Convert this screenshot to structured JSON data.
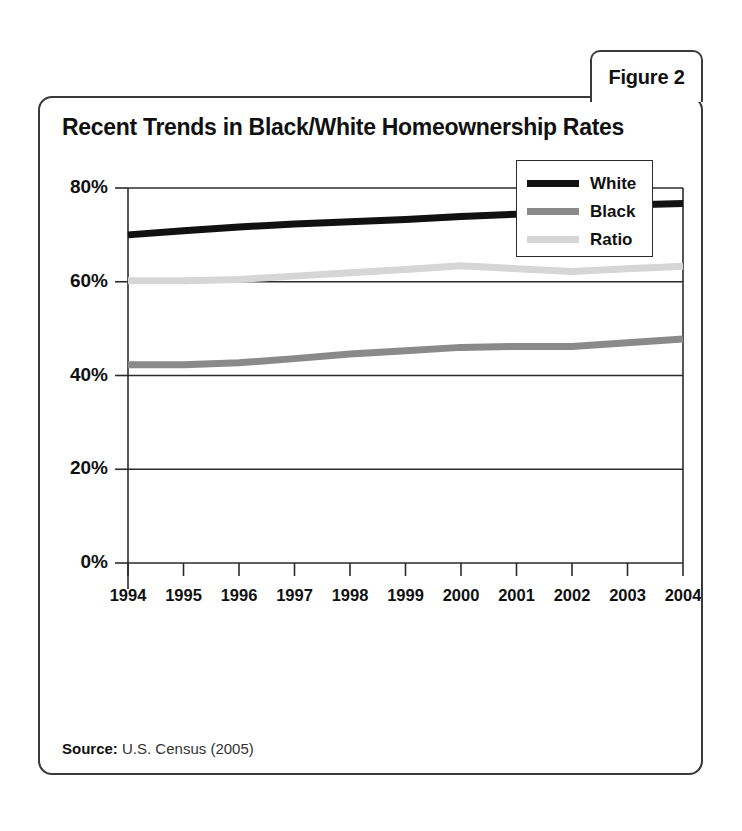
{
  "figure_tab": {
    "label": "Figure 2"
  },
  "card": {
    "title": "Recent Trends in Black/White Homeownership Rates"
  },
  "source": {
    "label": "Source:",
    "value": " U.S. Census (2005)"
  },
  "legend": {
    "position": "top-right-inside",
    "entries": [
      {
        "label": "White",
        "color": "#111111",
        "thickness": 7
      },
      {
        "label": "Black",
        "color": "#8a8a8a",
        "thickness": 7
      },
      {
        "label": "Ratio",
        "color": "#d6d6d6",
        "thickness": 7
      }
    ]
  },
  "chart_data": {
    "type": "line",
    "title": "Recent Trends in Black/White Homeownership Rates",
    "xlabel": "",
    "ylabel": "",
    "ylim": [
      0,
      80
    ],
    "ytick_labels": [
      "0%",
      "20%",
      "40%",
      "60%",
      "80%"
    ],
    "ytick_values": [
      0,
      20,
      40,
      60,
      80
    ],
    "grid": true,
    "grid_axis": "y",
    "legend_position": "upper right",
    "categories": [
      1994,
      1995,
      1996,
      1997,
      1998,
      1999,
      2000,
      2001,
      2002,
      2003,
      2004
    ],
    "x_tick_labels": [
      "1994",
      "1995",
      "1996",
      "1997",
      "1998",
      "1999",
      "2000",
      "2001",
      "2002",
      "2003",
      "2004"
    ],
    "series": [
      {
        "name": "White",
        "color": "#111111",
        "width": 7,
        "values": [
          70.0,
          70.9,
          71.7,
          72.3,
          72.8,
          73.3,
          73.9,
          74.4,
          74.9,
          76.4,
          76.7
        ]
      },
      {
        "name": "Black",
        "color": "#8a8a8a",
        "width": 7,
        "values": [
          42.3,
          42.3,
          42.7,
          43.6,
          44.6,
          45.3,
          46.0,
          46.2,
          46.2,
          47.0,
          47.8
        ]
      },
      {
        "name": "Ratio",
        "color": "#d6d6d6",
        "width": 7,
        "values": [
          60.2,
          60.2,
          60.5,
          61.2,
          61.9,
          62.6,
          63.4,
          62.8,
          62.2,
          62.8,
          63.3
        ]
      }
    ]
  }
}
